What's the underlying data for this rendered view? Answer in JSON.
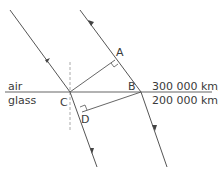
{
  "diagram": {
    "type": "refraction-wavefront",
    "media": {
      "top": {
        "label": "air",
        "speed": "300 000 km/s"
      },
      "bottom": {
        "label": "glass",
        "speed": "200 000 km/s"
      }
    },
    "points": {
      "A": "A",
      "B": "B",
      "C": "C",
      "D": "D"
    },
    "colors": {
      "line": "#555555",
      "interface": "#666666",
      "normal": "#aaaaaa",
      "text": "#3a3a3a"
    }
  }
}
